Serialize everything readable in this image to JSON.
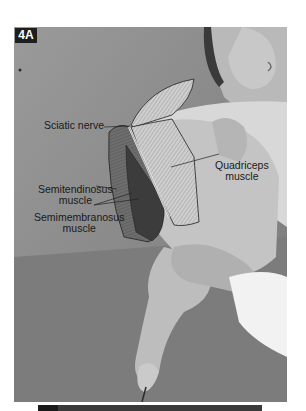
{
  "figure": {
    "panel_label": "4A",
    "style": "grayscale photograph with anatomical overlay illustration",
    "colors": {
      "background": "#ffffff",
      "photo_base": "#8f8f8f",
      "badge_bg": "#1e1e1e",
      "badge_text": "#ffffff",
      "label_text": "#1a1a1a",
      "bottom_bar": "#3a3a3a"
    }
  },
  "labels": {
    "sciatic_nerve": "Sciatic nerve",
    "quadriceps_line1": "Quadriceps",
    "quadriceps_line2": "muscle",
    "semitendinosus_line1": "Semitendinosus",
    "semitendinosus_line2": "muscle",
    "semimembranosus_line1": "Semimembranosus",
    "semimembranosus_line2": "muscle"
  }
}
